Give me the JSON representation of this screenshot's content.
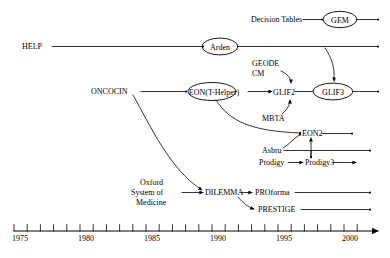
{
  "figure": {
    "type": "timeline-diagram",
    "stroke_color": "#000000",
    "background_color": "#ffffff"
  },
  "axis": {
    "label": "",
    "start_year": 1975,
    "end_year": 2001,
    "tick_interval": 1,
    "labeled_interval": 5,
    "labels": [
      "1975",
      "1980",
      "1985",
      "1990",
      "1995",
      "2000"
    ],
    "label_years": [
      1975,
      1980,
      1985,
      1990,
      1995,
      2000
    ]
  },
  "nodes": [
    {
      "id": "decision-tables",
      "label": "Decision Tables",
      "shape": "text",
      "year": 1995.2,
      "row": 0
    },
    {
      "id": "gem",
      "label": "GEM",
      "shape": "ellipse",
      "year": 1999.0,
      "row": 0
    },
    {
      "id": "help",
      "label": "HELP",
      "shape": "text",
      "year": 1976.5,
      "row": 1
    },
    {
      "id": "arden",
      "label": "Arden",
      "shape": "ellipse",
      "year": 1991.0,
      "row": 1
    },
    {
      "id": "geode-cm",
      "label": "GEODE\nCM",
      "shape": "text",
      "year": 1994.0,
      "row": 2
    },
    {
      "id": "oncocin",
      "label": "ONCOCIN",
      "shape": "text",
      "year": 1983.0,
      "row": 3
    },
    {
      "id": "eon-thelper",
      "label": "EON(T-Helper)",
      "shape": "ellipse",
      "year": 1991.0,
      "row": 3
    },
    {
      "id": "glif2",
      "label": "GLIF2",
      "shape": "text",
      "year": 1996.0,
      "row": 3
    },
    {
      "id": "glif3",
      "label": "GLIF3",
      "shape": "ellipse",
      "year": 1998.7,
      "row": 3
    },
    {
      "id": "mbta",
      "label": "MBTA",
      "shape": "text",
      "year": 1996.2,
      "row": 4
    },
    {
      "id": "eon2",
      "label": "EON2",
      "shape": "text",
      "year": 1998.8,
      "row": 5
    },
    {
      "id": "asbru",
      "label": "Asbru",
      "shape": "text",
      "year": 1996.5,
      "row": 6
    },
    {
      "id": "prodigy",
      "label": "Prodigy",
      "shape": "text",
      "year": 1996.8,
      "row": 7
    },
    {
      "id": "prodigy3",
      "label": "Prodigy3",
      "shape": "text",
      "year": 1998.8,
      "row": 7
    },
    {
      "id": "oxford-som",
      "label": "Oxford\nSystem of\nMedicine",
      "shape": "text",
      "year": 1987.0,
      "row": 8
    },
    {
      "id": "dilemma",
      "label": "DILEMMA",
      "shape": "text",
      "year": 1991.5,
      "row": 8
    },
    {
      "id": "proforma",
      "label": "PROforma",
      "shape": "text",
      "year": 1994.5,
      "row": 8
    },
    {
      "id": "prestige",
      "label": "PRESTIGE",
      "shape": "text",
      "year": 1995.0,
      "row": 9
    }
  ],
  "edges": [
    {
      "from": "decision-tables",
      "to": "gem",
      "style": "straight"
    },
    {
      "from": "gem",
      "to": "axis-end",
      "style": "straight"
    },
    {
      "from": "help",
      "to": "arden",
      "style": "straight"
    },
    {
      "from": "arden",
      "to": "axis-end",
      "style": "straight"
    },
    {
      "from": "arden-line",
      "to": "glif3",
      "style": "curved"
    },
    {
      "from": "geode-cm",
      "to": "glif2",
      "style": "curved"
    },
    {
      "from": "oncocin",
      "to": "eon-thelper",
      "style": "straight"
    },
    {
      "from": "eon-thelper",
      "to": "glif2",
      "style": "straight"
    },
    {
      "from": "glif2",
      "to": "glif3",
      "style": "straight"
    },
    {
      "from": "glif3",
      "to": "axis-end",
      "style": "straight"
    },
    {
      "from": "mbta",
      "to": "glif2",
      "style": "curved"
    },
    {
      "from": "eon-thelper",
      "to": "eon2",
      "style": "curved"
    },
    {
      "from": "asbru",
      "to": "eon2",
      "style": "curved"
    },
    {
      "from": "eon2",
      "to": "axis-end",
      "style": "straight"
    },
    {
      "from": "asbru",
      "to": "axis-end",
      "style": "straight"
    },
    {
      "from": "prodigy",
      "to": "prodigy3",
      "style": "straight"
    },
    {
      "from": "prodigy3",
      "to": "axis-end",
      "style": "straight"
    },
    {
      "from": "prodigy3-line",
      "to": "eon2",
      "style": "vertical"
    },
    {
      "from": "oncocin",
      "to": "dilemma",
      "style": "curved"
    },
    {
      "from": "oxford-som",
      "to": "dilemma",
      "style": "straight"
    },
    {
      "from": "dilemma",
      "to": "proforma",
      "style": "straight"
    },
    {
      "from": "dilemma",
      "to": "prestige",
      "style": "curved"
    },
    {
      "from": "proforma",
      "to": "axis-end",
      "style": "straight"
    },
    {
      "from": "prestige",
      "to": "axis-end",
      "style": "straight"
    }
  ],
  "labels": {
    "decision_tables": "Decision Tables",
    "gem": "GEM",
    "help": "HELP",
    "arden": "Arden",
    "geode": "GEODE",
    "cm": "CM",
    "oncocin": "ONCOCIN",
    "eon_thelper": "EON(T-Helper)",
    "glif2": "GLIF2",
    "glif3": "GLIF3",
    "mbta": "MBTA",
    "eon2": "EON2",
    "asbru": "Asbru",
    "prodigy": "Prodigy",
    "prodigy3": "Prodigy3",
    "oxford": "Oxford",
    "system_of": "System of",
    "medicine": "Medicine",
    "dilemma": "DILEMMA",
    "proforma": "PROforma",
    "prestige": "PRESTIGE",
    "year_1975": "1975",
    "year_1980": "1980",
    "year_1985": "1985",
    "year_1990": "1990",
    "year_1995": "1995",
    "year_2000": "2000"
  }
}
